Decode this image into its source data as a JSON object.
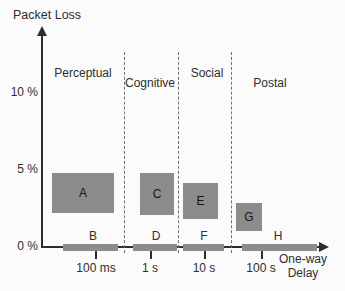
{
  "colors": {
    "box_fill": "#8c8c8c",
    "axis": "#2e2e2e",
    "dashed": "#6f6f6f"
  },
  "axes": {
    "y_title": "Packet Loss",
    "x_title_line1": "One-way",
    "x_title_line2": "Delay",
    "y_ticks": [
      {
        "label": "10 %"
      },
      {
        "label": "5 %"
      },
      {
        "label": "0 %"
      }
    ],
    "x_ticks": [
      {
        "label": "100 ms"
      },
      {
        "label": "1 s"
      },
      {
        "label": "10 s"
      },
      {
        "label": "100 s"
      }
    ]
  },
  "regions": [
    {
      "label": "Perceptual"
    },
    {
      "label": "Cognitive"
    },
    {
      "label": "Social"
    },
    {
      "label": "Postal"
    }
  ],
  "boxes": [
    {
      "label": "A"
    },
    {
      "label": "C"
    },
    {
      "label": "E"
    },
    {
      "label": "G"
    }
  ],
  "bars": [
    {
      "label": "B"
    },
    {
      "label": "D"
    },
    {
      "label": "F"
    },
    {
      "label": "H"
    }
  ],
  "chart_data": {
    "type": "bar",
    "xlabel": "One-way Delay",
    "ylabel": "Packet Loss",
    "x_scale": "log",
    "x_tick_values_s": [
      0.1,
      1,
      10,
      100
    ],
    "x_tick_labels": [
      "100 ms",
      "1 s",
      "10 s",
      "100 s"
    ],
    "y_tick_labels": [
      "0 %",
      "5 %",
      "10 %"
    ],
    "ylim_pct": [
      0,
      14
    ],
    "grid": false,
    "legend": "none",
    "regions": [
      {
        "name": "Perceptual",
        "delay_range_s": [
          0.01,
          0.3
        ]
      },
      {
        "name": "Cognitive",
        "delay_range_s": [
          0.3,
          3
        ]
      },
      {
        "name": "Social",
        "delay_range_s": [
          3,
          30
        ]
      },
      {
        "name": "Postal",
        "delay_range_s": [
          30,
          1000
        ]
      }
    ],
    "boxes": [
      {
        "label": "A",
        "region": "Perceptual",
        "delay_range_s": [
          0.016,
          0.21
        ],
        "loss_range_pct": [
          2.1,
          4.7
        ]
      },
      {
        "label": "B",
        "region": "Perceptual",
        "delay_range_s": [
          0.025,
          0.25
        ],
        "loss_range_pct": [
          0,
          0
        ]
      },
      {
        "label": "C",
        "region": "Cognitive",
        "delay_range_s": [
          0.63,
          2.6
        ],
        "loss_range_pct": [
          2.0,
          4.7
        ]
      },
      {
        "label": "D",
        "region": "Cognitive",
        "delay_range_s": [
          0.47,
          3.0
        ],
        "loss_range_pct": [
          0,
          0
        ]
      },
      {
        "label": "E",
        "region": "Social",
        "delay_range_s": [
          4.0,
          17
        ],
        "loss_range_pct": [
          1.8,
          4.1
        ]
      },
      {
        "label": "F",
        "region": "Social",
        "delay_range_s": [
          4.0,
          22
        ],
        "loss_range_pct": [
          0,
          0
        ]
      },
      {
        "label": "G",
        "region": "Postal",
        "delay_range_s": [
          34,
          100
        ],
        "loss_range_pct": [
          1.0,
          2.8
        ]
      },
      {
        "label": "H",
        "region": "Postal",
        "delay_range_s": [
          43,
          1000
        ],
        "loss_range_pct": [
          0,
          0
        ]
      }
    ]
  }
}
